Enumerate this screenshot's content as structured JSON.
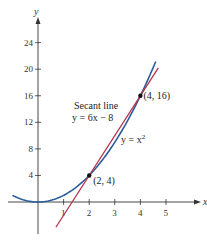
{
  "chart_data": {
    "type": "line",
    "title": "",
    "xlabel": "x",
    "ylabel": "y",
    "xlim": [
      -1.4,
      5.8
    ],
    "ylim": [
      -6,
      27
    ],
    "grid": false,
    "x_ticks": [
      1,
      2,
      3,
      4,
      5
    ],
    "x_tick_labels": [
      "1",
      "2",
      "3",
      "4",
      "5"
    ],
    "y_ticks": [
      4,
      8,
      12,
      16,
      20,
      24
    ],
    "y_tick_labels": [
      "4",
      "8",
      "12",
      "16",
      "20",
      "24"
    ],
    "series": [
      {
        "name": "y = x^2",
        "label": "y = x",
        "label_sup": "2",
        "color": "#2a5d9b",
        "x_range": [
          -1.0,
          4.6
        ],
        "expression": "x^2"
      },
      {
        "name": "Secant line y = 6x - 8",
        "label_line1": "Secant line",
        "label_line2": "y = 6x − 8",
        "color": "#b5334a",
        "x_range": [
          0.7,
          4.7
        ],
        "expression": "6x - 8"
      }
    ],
    "points": [
      {
        "x": 2,
        "y": 4,
        "label": "(2, 4)"
      },
      {
        "x": 4,
        "y": 16,
        "label": "(4, 16)"
      }
    ]
  }
}
